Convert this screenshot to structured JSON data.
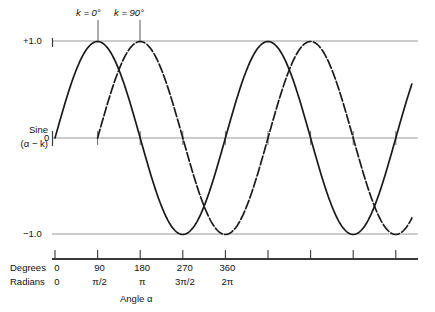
{
  "figure": {
    "y_axis": {
      "label_line1": "Sine",
      "label_line2": "(α − k)",
      "tick_plus1": "+1.0",
      "tick_zero": "0",
      "tick_minus1": "−1.0"
    },
    "x_axis": {
      "title": "Angle α",
      "row_degrees_name": "Degrees",
      "row_radians_name": "Radians",
      "degrees_labels": [
        "0",
        "90",
        "180",
        "270",
        "360"
      ],
      "radians_labels": [
        "0",
        "π/2",
        "π",
        "3π/2",
        "2π"
      ]
    },
    "annotations": [
      {
        "text_prefix": "k",
        "text": "k = 0°",
        "eq": " = 0",
        "deg": "°"
      },
      {
        "text_prefix": "k",
        "text": "k = 90°",
        "eq": " = 90",
        "deg": "°"
      }
    ]
  },
  "chart_data": {
    "type": "line",
    "title": "",
    "xlabel": "Angle α",
    "ylabel": "Sine (α − k)",
    "xlim_deg": [
      0,
      810
    ],
    "ylim": [
      -1.0,
      1.0
    ],
    "grid": true,
    "gridlines_y": [
      1.0,
      0.0,
      -1.0
    ],
    "x_tick_degrees": [
      0,
      90,
      180,
      270,
      360,
      450,
      540,
      630,
      720
    ],
    "x_tick_labels_degrees": [
      "0",
      "90",
      "180",
      "270",
      "360",
      "",
      "",
      "",
      ""
    ],
    "x_tick_labels_radians": [
      "0",
      "π/2",
      "π",
      "3π/2",
      "2π",
      "",
      "",
      "",
      ""
    ],
    "legend_position": "inline-annotations",
    "series": [
      {
        "name": "k = 0°",
        "formula": "sin(α − 0°)",
        "phase_shift_deg": 0,
        "style": "solid",
        "color": "#1a1a1a",
        "annotation_label": "k = 0°",
        "annotation_at_deg": 90,
        "x_deg": [
          0,
          15,
          30,
          45,
          60,
          75,
          90,
          105,
          120,
          135,
          150,
          165,
          180,
          195,
          210,
          225,
          240,
          255,
          270,
          285,
          300,
          315,
          330,
          345,
          360,
          375,
          390,
          405,
          420,
          435,
          450,
          465,
          480,
          495,
          510,
          525,
          540,
          555,
          570,
          585,
          600,
          615,
          630,
          645,
          660,
          675,
          690,
          705,
          720,
          735,
          750,
          765,
          780
        ],
        "values": [
          0,
          0.259,
          0.5,
          0.707,
          0.866,
          0.966,
          1,
          0.966,
          0.866,
          0.707,
          0.5,
          0.259,
          0,
          -0.259,
          -0.5,
          -0.707,
          -0.866,
          -0.966,
          -1,
          -0.966,
          -0.866,
          -0.707,
          -0.5,
          -0.259,
          0,
          0.259,
          0.5,
          0.707,
          0.866,
          0.966,
          1,
          0.966,
          0.866,
          0.707,
          0.5,
          0.259,
          0,
          -0.259,
          -0.5,
          -0.707,
          -0.866,
          -0.966,
          -1,
          -0.966,
          -0.866,
          -0.707,
          -0.5,
          -0.259,
          0,
          0.259,
          0.5,
          0.707,
          0.866
        ]
      },
      {
        "name": "k = 90°",
        "formula": "sin(α − 90°)",
        "phase_shift_deg": 90,
        "style": "dashed",
        "color": "#1a1a1a",
        "annotation_label": "k = 90°",
        "annotation_at_deg": 180,
        "x_deg": [
          90,
          105,
          120,
          135,
          150,
          165,
          180,
          195,
          210,
          225,
          240,
          255,
          270,
          285,
          300,
          315,
          330,
          345,
          360,
          375,
          390,
          405,
          420,
          435,
          450,
          465,
          480,
          495,
          510,
          525,
          540,
          555,
          570,
          585,
          600,
          615,
          630,
          645,
          660,
          675,
          690,
          705,
          720,
          735,
          750,
          765,
          780
        ],
        "values": [
          0,
          0.259,
          0.5,
          0.707,
          0.866,
          0.966,
          1,
          0.966,
          0.866,
          0.707,
          0.5,
          0.259,
          0,
          -0.259,
          -0.5,
          -0.707,
          -0.866,
          -0.966,
          -1,
          -0.966,
          -0.866,
          -0.707,
          -0.5,
          -0.259,
          0,
          0.259,
          0.5,
          0.707,
          0.866,
          0.966,
          1,
          0.966,
          0.866,
          0.707,
          0.5,
          0.259,
          0,
          -0.259,
          -0.5,
          -0.707,
          -0.866,
          -0.966,
          -1,
          -0.966,
          -0.866,
          -0.707,
          -0.5
        ]
      }
    ]
  }
}
